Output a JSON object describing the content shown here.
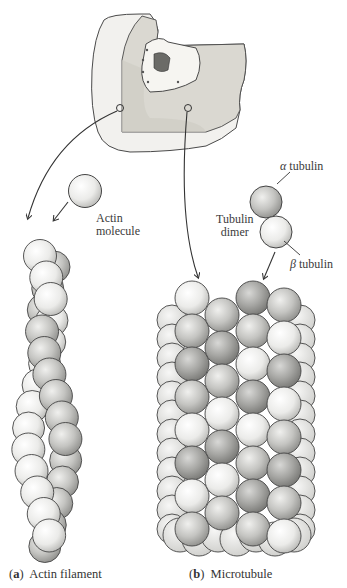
{
  "figure": {
    "cell_illustration": {
      "description": "Cutaway cell with nucleus; two callout circles on cytoplasm"
    },
    "labels": {
      "actin_molecule_line1": "Actin",
      "actin_molecule_line2": "molecule",
      "alpha_tubulin_symbol": "α",
      "alpha_tubulin_word": "tubulin",
      "tubulin_dimer_line1": "Tubulin",
      "tubulin_dimer_line2": "dimer",
      "beta_tubulin_symbol": "β",
      "beta_tubulin_word": "tubulin"
    },
    "captions": {
      "a_letter": "a",
      "a_text": "Actin filament",
      "b_letter": "b",
      "b_text": "Microtubule"
    },
    "colors": {
      "sphere_light": "#f4f4f2",
      "sphere_mid": "#c9c9c6",
      "sphere_dark": "#9a9a97",
      "outline": "#3a3a3a",
      "cell_fill": "#e4e2dc",
      "nucleus": "#6e6e6a"
    }
  }
}
